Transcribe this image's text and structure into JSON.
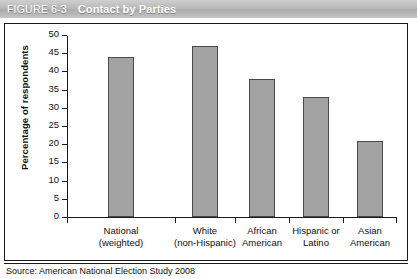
{
  "header": {
    "figure_number": "FIGURE 6-3",
    "title": "Contact by Parties"
  },
  "source": {
    "text": "Source: American National Election Study 2008"
  },
  "chart_data": {
    "type": "bar",
    "title": "Contact by Parties",
    "xlabel": "",
    "ylabel": "Percentage of respondents",
    "ylim": [
      0,
      50
    ],
    "yticks": [
      0,
      5,
      10,
      15,
      20,
      25,
      30,
      35,
      40,
      45,
      50
    ],
    "ytick_labels": [
      "0",
      "5",
      "10",
      "15",
      "20",
      "25",
      "30",
      "35",
      "40",
      "45",
      "50"
    ],
    "grid": false,
    "legend": null,
    "bar_color": "#a3a3a3",
    "bar_border_color": "#4a4a4a",
    "categories": [
      "National (weighted)",
      "White (non-Hispanic)",
      "African American",
      "Hispanic or Latino",
      "Asian American"
    ],
    "category_lines": [
      [
        "National",
        "(weighted)"
      ],
      [
        "White",
        "(non-Hispanic)"
      ],
      [
        "African",
        "American"
      ],
      [
        "Hispanic or",
        "Latino"
      ],
      [
        "Asian",
        "American"
      ]
    ],
    "values": [
      44,
      47,
      38,
      33,
      21
    ]
  }
}
